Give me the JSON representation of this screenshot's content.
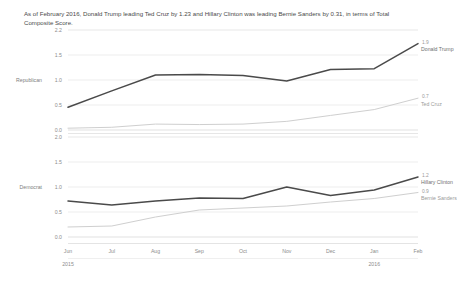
{
  "title": "As of February 2016, Donald Trump leading Ted Cruz by 1.23 and Hillary Clinton was leading Bernie Sanders by 0.31, in terms of Total Composite Score.",
  "axis": {
    "republican_label": "Republican",
    "democrat_label": "Democrat",
    "yticks_top": [
      "2.2",
      "1.5",
      "1.0",
      "0.5",
      "0.0"
    ],
    "yticks_bottom": [
      "2.0",
      "1.5",
      "1.0",
      "0.5",
      "0.0"
    ],
    "xticks": [
      "Jun",
      "Jul",
      "Aug",
      "Sep",
      "Oct",
      "Nov",
      "Dec",
      "Jan",
      "Feb"
    ],
    "year_left": "2015",
    "year_right": "2016"
  },
  "series_labels": {
    "trump_name": "Donald Trump",
    "trump_value": "1.9",
    "cruz_name": "Ted Cruz",
    "cruz_value": "0.7",
    "clinton_name": "Hillary Clinton",
    "clinton_value": "1.2",
    "sanders_name": "Bernie Sanders",
    "sanders_value": "0.9"
  },
  "colors": {
    "dark_line": "#4a4a4a",
    "light_line": "#cfcfcf",
    "grid": "#ededed",
    "text": "#5b5b5b"
  },
  "chart_data": {
    "type": "line",
    "title": "As of February 2016, Donald Trump leading Ted Cruz by 1.23 and Hillary Clinton was leading Bernie Sanders by 0.31, in terms of Total Composite Score.",
    "xlabel": "",
    "ylabel": "Total Composite Score",
    "x": [
      "Jun 2015",
      "Jul 2015",
      "Aug 2015",
      "Sep 2015",
      "Oct 2015",
      "Nov 2015",
      "Dec 2015",
      "Jan 2016",
      "Feb 2016"
    ],
    "grid": true,
    "legend": "line-end-labels",
    "panels": [
      {
        "name": "Republican",
        "ylim": [
          0.0,
          2.2
        ],
        "yticks": [
          0.0,
          0.5,
          1.0,
          1.5,
          2.2
        ],
        "series": [
          {
            "name": "Donald Trump",
            "style": "dark",
            "end_label": "1.9",
            "values": [
              0.5,
              0.86,
              1.21,
              1.22,
              1.2,
              1.08,
              1.33,
              1.35,
              1.9
            ]
          },
          {
            "name": "Ted Cruz",
            "style": "light",
            "end_label": "0.7",
            "values": [
              0.04,
              0.06,
              0.13,
              0.12,
              0.13,
              0.19,
              0.32,
              0.45,
              0.7
            ]
          }
        ]
      },
      {
        "name": "Democrat",
        "ylim": [
          0.0,
          2.0
        ],
        "yticks": [
          0.0,
          0.5,
          1.0,
          1.5,
          2.0
        ],
        "series": [
          {
            "name": "Hillary Clinton",
            "style": "dark",
            "end_label": "1.2",
            "values": [
              0.72,
              0.64,
              0.72,
              0.78,
              0.77,
              1.0,
              0.83,
              0.94,
              1.2
            ]
          },
          {
            "name": "Bernie Sanders",
            "style": "light",
            "end_label": "0.9",
            "values": [
              0.2,
              0.22,
              0.4,
              0.54,
              0.58,
              0.62,
              0.7,
              0.77,
              0.89
            ]
          }
        ]
      }
    ]
  }
}
